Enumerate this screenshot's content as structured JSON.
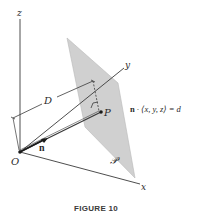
{
  "figure": {
    "caption": "FIGURE 10",
    "colors": {
      "plane_fill": "#d0d0d0",
      "line": "#3a3a3a",
      "text": "#2a2a2a"
    },
    "axes": {
      "x_label": "x",
      "y_label": "y",
      "z_label": "z",
      "origin_label": "O"
    },
    "labels": {
      "distance": "D",
      "normal_vector": "n",
      "point": "P",
      "plane": "𝒫",
      "equation_n": "n",
      "equation_rest": " · ⟨x, y, z⟩ = d"
    }
  }
}
